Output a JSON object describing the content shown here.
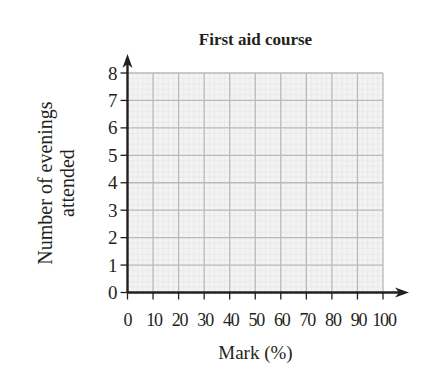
{
  "chart_data": {
    "type": "bar",
    "title": "First aid course",
    "xlabel": "Mark (%)",
    "ylabel": "Number of evenings attended",
    "ylabel_lines": [
      "Number of evenings",
      "attended"
    ],
    "x_ticks": [
      0,
      10,
      20,
      30,
      40,
      50,
      60,
      70,
      80,
      90,
      100
    ],
    "y_ticks": [
      0,
      1,
      2,
      3,
      4,
      5,
      6,
      7,
      8
    ],
    "xlim": [
      0,
      100
    ],
    "ylim": [
      0,
      8
    ],
    "grid": true,
    "minor_grid": true,
    "legend": null,
    "series": [],
    "note": "Blank grid with no data plotted"
  },
  "colors": {
    "axis": "#231f20",
    "major_grid": "#b9b9b9",
    "minor_grid": "#e4e4e4",
    "plot_background": "#f3f3f3"
  }
}
